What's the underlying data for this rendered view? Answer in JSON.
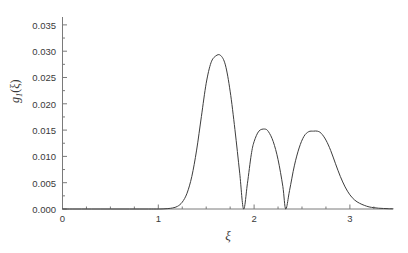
{
  "chart_data": {
    "type": "line",
    "title": "",
    "subtitle": "",
    "xlabel": "ξ",
    "ylabel": "g₁(ξ)",
    "ylabel_base": "g",
    "ylabel_sub": "1",
    "ylabel_arg": "(ξ)",
    "xlim": [
      0,
      3.45
    ],
    "ylim": [
      0.0,
      0.0365
    ],
    "xticks": [
      0,
      1,
      2,
      3
    ],
    "xtick_labels": [
      "0",
      "1",
      "2",
      "3"
    ],
    "yticks": [
      0.0,
      0.005,
      0.01,
      0.015,
      0.02,
      0.025,
      0.03,
      0.035
    ],
    "ytick_labels": [
      "0.000",
      "0.005",
      "0.010",
      "0.015",
      "0.020",
      "0.025",
      "0.030",
      "0.035"
    ],
    "x_minor_tick_interval": 0.25,
    "y_minor_tick_interval": 0.0025,
    "grid": false,
    "legend": null,
    "line_color": "#3d3d3d",
    "line_width": 1.0,
    "axis_color": "#7a7a7a",
    "background": "#ffffff",
    "peaks": [
      {
        "x": 1.65,
        "y": 0.0292
      },
      {
        "x": 2.11,
        "y": 0.0152
      },
      {
        "x": 2.66,
        "y": 0.0148
      }
    ],
    "minima": [
      {
        "x": 1.89,
        "y": 0.0
      },
      {
        "x": 2.33,
        "y": 0.0
      }
    ],
    "x": [
      0.0,
      0.1,
      0.2,
      0.3,
      0.4,
      0.5,
      0.6,
      0.7,
      0.8,
      0.9,
      1.0,
      1.05,
      1.1,
      1.15,
      1.2,
      1.25,
      1.3,
      1.35,
      1.4,
      1.45,
      1.5,
      1.55,
      1.6,
      1.65,
      1.7,
      1.75,
      1.8,
      1.85,
      1.89,
      1.93,
      1.97,
      2.0,
      2.05,
      2.11,
      2.15,
      2.2,
      2.25,
      2.3,
      2.33,
      2.37,
      2.42,
      2.47,
      2.52,
      2.57,
      2.62,
      2.66,
      2.7,
      2.75,
      2.8,
      2.85,
      2.9,
      2.95,
      3.0,
      3.05,
      3.1,
      3.15,
      3.2,
      3.25,
      3.3,
      3.35,
      3.4,
      3.45
    ],
    "y": [
      0.0,
      0.0,
      0.0,
      0.0,
      0.0,
      0.0,
      0.0,
      0.0,
      0.0,
      0.0,
      0.0,
      2e-05,
      8e-05,
      0.0002,
      0.0005,
      0.0013,
      0.003,
      0.0062,
      0.0112,
      0.0176,
      0.0239,
      0.0278,
      0.0291,
      0.0292,
      0.0274,
      0.0224,
      0.0151,
      0.0068,
      0.0,
      0.0048,
      0.0103,
      0.0128,
      0.0148,
      0.0152,
      0.0147,
      0.0128,
      0.0094,
      0.0043,
      0.0,
      0.0035,
      0.0082,
      0.0116,
      0.0138,
      0.0147,
      0.0148,
      0.0148,
      0.0144,
      0.0131,
      0.0111,
      0.0086,
      0.0062,
      0.0042,
      0.0027,
      0.0017,
      0.0011,
      0.0007,
      0.0004,
      0.00025,
      0.00015,
      0.0001,
      6e-05,
      4e-05
    ]
  },
  "axes": {
    "left_px": 62.5,
    "right_px": 393.0,
    "top_px": 17.0,
    "bottom_px": 209.0
  }
}
